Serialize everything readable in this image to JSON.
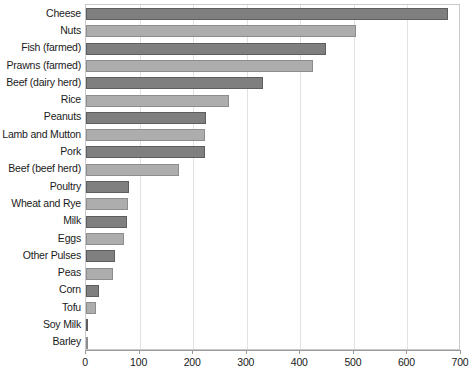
{
  "chart_data": {
    "type": "bar",
    "orientation": "horizontal",
    "title": "",
    "subtitle": "",
    "xlabel": "",
    "ylabel": "",
    "xlim": [
      0,
      700
    ],
    "ylim": null,
    "grid": true,
    "legend": null,
    "xticks": [
      0,
      100,
      200,
      300,
      400,
      500,
      600,
      700
    ],
    "xticklabels": [
      "0",
      "100",
      "200",
      "300",
      "400",
      "500",
      "600",
      "700"
    ],
    "categories": [
      "Cheese",
      "Nuts",
      "Fish (farmed)",
      "Prawns (farmed)",
      "Beef (dairy herd)",
      "Rice",
      "Peanuts",
      "Lamb and Mutton",
      "Pork",
      "Beef (beef herd)",
      "Poultry",
      "Wheat and Rye",
      "Milk",
      "Eggs",
      "Other Pulses",
      "Peas",
      "Corn",
      "Tofu",
      "Soy Milk",
      "Barley"
    ],
    "values": [
      675,
      504,
      448,
      424,
      331,
      267,
      224,
      222,
      222,
      174,
      80,
      79,
      76,
      70,
      55,
      51,
      25,
      19,
      3,
      1
    ],
    "bar_colors": [
      "#7f7f7f",
      "#adadad",
      "#7f7f7f",
      "#adadad",
      "#7f7f7f",
      "#adadad",
      "#7f7f7f",
      "#adadad",
      "#7f7f7f",
      "#adadad",
      "#7f7f7f",
      "#adadad",
      "#7f7f7f",
      "#adadad",
      "#7f7f7f",
      "#adadad",
      "#7f7f7f",
      "#adadad",
      "#7f7f7f",
      "#adadad"
    ],
    "colors": {
      "dark_bar": "#7f7f7f",
      "light_bar": "#adadad",
      "grid": "#e2e2e2",
      "frame": "#c9c9c9",
      "axis": "#9a9a9a",
      "text": "#1a1a1a",
      "background": "#ffffff"
    }
  }
}
